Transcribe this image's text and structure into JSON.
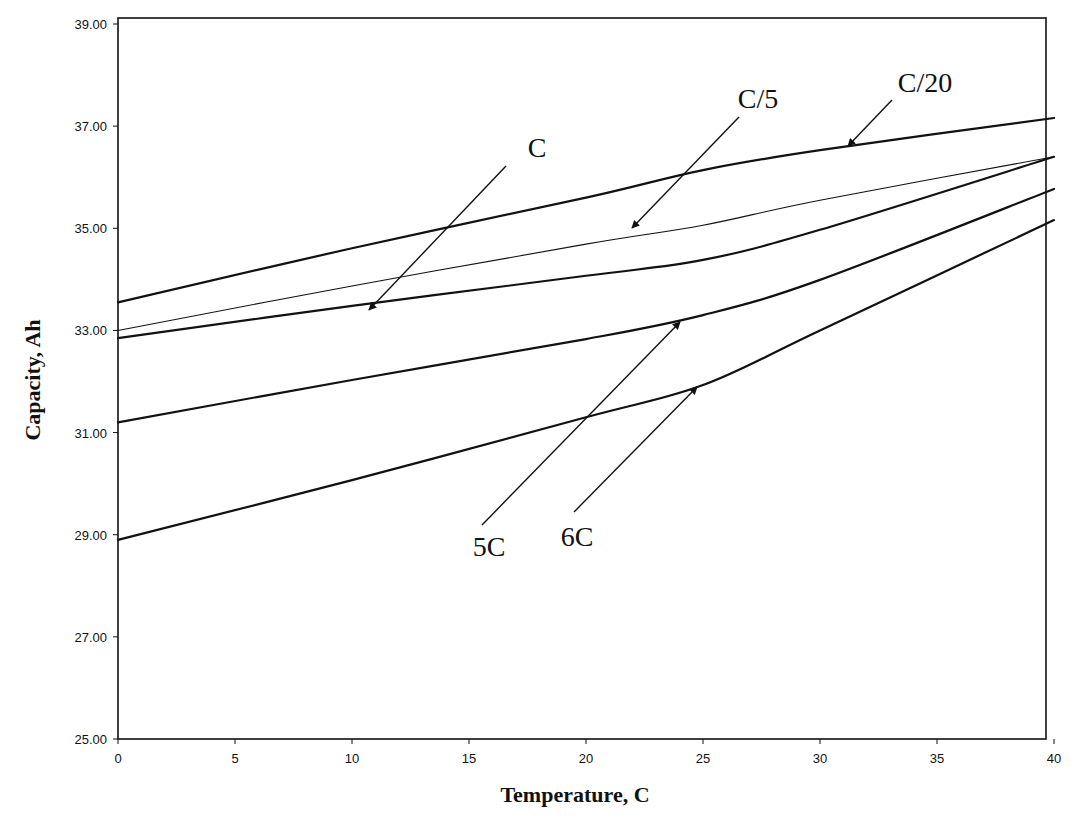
{
  "chart_data": {
    "type": "line",
    "title": "",
    "xlabel": "Temperature, C",
    "ylabel": "Capacity, Ah",
    "xlim": [
      0,
      40
    ],
    "ylim": [
      25,
      39
    ],
    "x_ticks": [
      "0",
      "5",
      "10",
      "15",
      "20",
      "25",
      "30",
      "35",
      "40"
    ],
    "y_ticks": [
      "25.00",
      "27.00",
      "29.00",
      "31.00",
      "33.00",
      "35.00",
      "37.00",
      "39.00"
    ],
    "grid": false,
    "legend": "none (curves labeled with arrow annotations)",
    "x": [
      0,
      10,
      20,
      25,
      30,
      40
    ],
    "series": [
      {
        "name": "C/20",
        "values": [
          33.55,
          34.61,
          35.6,
          36.14,
          36.53,
          37.16
        ],
        "stroke_width": 2.2
      },
      {
        "name": "C/5",
        "values": [
          33.0,
          33.87,
          34.69,
          35.06,
          35.55,
          36.4
        ],
        "stroke_width": 1.1
      },
      {
        "name": "C",
        "values": [
          32.85,
          33.48,
          34.07,
          34.38,
          34.97,
          36.4
        ],
        "stroke_width": 2.2
      },
      {
        "name": "5C",
        "values": [
          31.2,
          32.03,
          32.83,
          33.3,
          33.99,
          35.77
        ],
        "stroke_width": 2.2
      },
      {
        "name": "6C",
        "values": [
          28.9,
          30.07,
          31.3,
          31.93,
          33.0,
          35.16
        ],
        "stroke_width": 2.2
      }
    ],
    "annotations": [
      {
        "text": "C/20",
        "label_x": 925,
        "label_y": 92,
        "arrow_from": [
          892,
          100
        ],
        "arrow_to": [
          848,
          146
        ]
      },
      {
        "text": "C/5",
        "label_x": 758,
        "label_y": 108,
        "arrow_from": [
          739,
          117
        ],
        "arrow_to": [
          632,
          228
        ]
      },
      {
        "text": "C",
        "label_x": 537,
        "label_y": 157,
        "arrow_from": [
          506,
          166
        ],
        "arrow_to": [
          369,
          310
        ]
      },
      {
        "text": "5C",
        "label_x": 489,
        "label_y": 556,
        "arrow_from": [
          482,
          525
        ],
        "arrow_to": [
          680,
          322
        ]
      },
      {
        "text": "6C",
        "label_x": 577,
        "label_y": 546,
        "arrow_from": [
          574,
          512
        ],
        "arrow_to": [
          697,
          387
        ]
      }
    ]
  }
}
